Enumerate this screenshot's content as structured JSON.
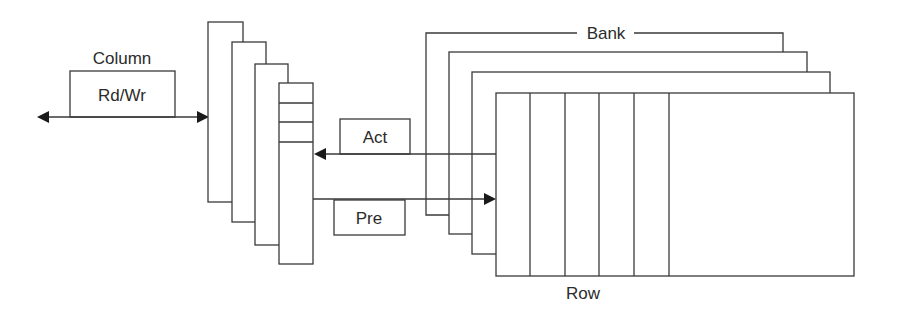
{
  "diagram": {
    "type": "dram-organization",
    "labels": {
      "column": "Column",
      "rdwr": "Rd/Wr",
      "act": "Act",
      "pre": "Pre",
      "bank": "Bank",
      "row": "Row"
    },
    "colors": {
      "line": "#3a3a3a",
      "text": "#2b2b2b",
      "background": "#ffffff"
    },
    "column_buffers": {
      "count": 4,
      "slots_in_front": 3
    },
    "banks": {
      "count": 4,
      "columns_in_front": 5
    },
    "arrows": [
      {
        "name": "rdwr-bidirectional",
        "from": "external",
        "to": "column-buffers",
        "label": "Rd/Wr"
      },
      {
        "name": "act-arrow",
        "from": "bank",
        "to": "column-buffers",
        "label": "Act"
      },
      {
        "name": "pre-arrow",
        "from": "column-buffers",
        "to": "bank",
        "label": "Pre"
      }
    ]
  }
}
